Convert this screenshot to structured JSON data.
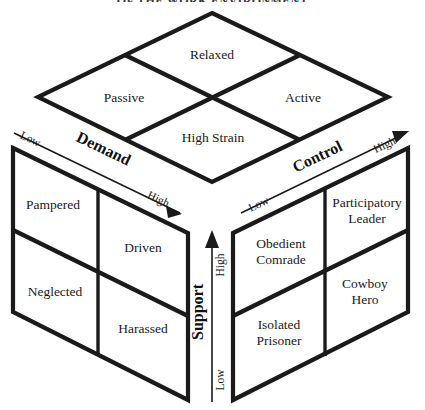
{
  "figure": {
    "title_clipped": "OF THE WORK ENVIRONMENT",
    "type": "isometric-cube-model"
  },
  "axes": {
    "demand": {
      "name": "Demand",
      "low": "Low",
      "high": "High"
    },
    "control": {
      "name": "Control",
      "low": "Low",
      "high": "High"
    },
    "support": {
      "name": "Support",
      "low": "Low",
      "high": "High"
    }
  },
  "top_face": {
    "name": "demand-control-face",
    "cells": [
      {
        "id": "relaxed",
        "label": "Relaxed"
      },
      {
        "id": "passive",
        "label": "Passive"
      },
      {
        "id": "active",
        "label": "Active"
      },
      {
        "id": "high-strain",
        "label": "High Strain"
      }
    ]
  },
  "left_face": {
    "name": "demand-support-face",
    "cells": [
      {
        "id": "pampered",
        "label": "Pampered"
      },
      {
        "id": "driven",
        "label": "Driven"
      },
      {
        "id": "neglected",
        "label": "Neglected"
      },
      {
        "id": "harassed",
        "label": "Harassed"
      }
    ]
  },
  "right_face": {
    "name": "control-support-face",
    "cells": [
      {
        "id": "participatory-leader",
        "label": "Participatory",
        "label2": "Leader"
      },
      {
        "id": "obedient-comrade",
        "label": "Obedient",
        "label2": "Comrade"
      },
      {
        "id": "cowboy-hero",
        "label": "Cowboy",
        "label2": "Hero"
      },
      {
        "id": "isolated-prisoner",
        "label": "Isolated",
        "label2": "Prisoner"
      }
    ]
  },
  "colors": {
    "ink": "#1a1a1a",
    "background": "#ffffff"
  }
}
